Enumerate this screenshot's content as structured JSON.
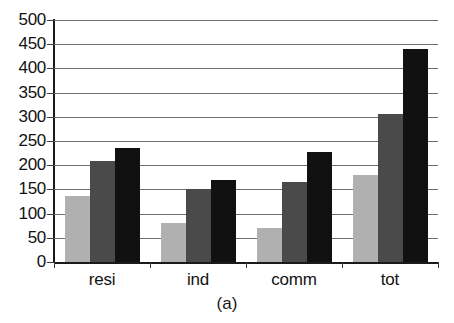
{
  "chart_data": {
    "type": "bar",
    "title": "",
    "subtitle": "",
    "caption": "(a)",
    "xlabel": "",
    "ylabel": "",
    "categories": [
      "resi",
      "ind",
      "comm",
      "tot"
    ],
    "ylim": [
      0,
      500
    ],
    "ytick_labels": [
      "500",
      "450",
      "400",
      "350",
      "300",
      "250",
      "200",
      "150",
      "100",
      "50",
      "0"
    ],
    "ytick_values": [
      500,
      450,
      400,
      350,
      300,
      250,
      200,
      150,
      100,
      50,
      0
    ],
    "ytick_step": 50,
    "grid": true,
    "grid_axis": "y",
    "legend": false,
    "legend_position": "none",
    "series": [
      {
        "name": "series-1",
        "color": "#b0b0b0",
        "values": [
          137,
          80,
          70,
          180
        ]
      },
      {
        "name": "series-2",
        "color": "#4a4a4a",
        "values": [
          209,
          150,
          165,
          306
        ]
      },
      {
        "name": "series-3",
        "color": "#111111",
        "values": [
          235,
          170,
          228,
          441
        ]
      }
    ]
  },
  "colors": {
    "background": "#ffffff",
    "axis": "#1a1a1a",
    "grid": "#6e6e6e",
    "text": "#121212"
  }
}
